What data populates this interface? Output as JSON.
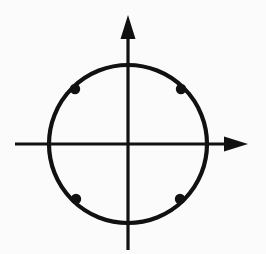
{
  "figure": {
    "background_color": "#fbfbfb",
    "stroke_color": "#111111",
    "width": 266,
    "height": 254
  },
  "chart_data": {
    "type": "scatter",
    "subtitle": "",
    "xlabel": "",
    "ylabel": "",
    "grid": false,
    "legend": null,
    "legend_position": "none",
    "axis_style": "arrowed-cartesian",
    "origin_px": {
      "x": 128,
      "y": 144
    },
    "xlim": [
      -1.43,
      1.52
    ],
    "ylim": [
      -1.34,
      1.63
    ],
    "x_ticks": [],
    "y_ticks": [],
    "x_tick_labels": [],
    "y_tick_labels": [],
    "annotations": [],
    "shapes": [
      {
        "name": "circle",
        "kind": "circle",
        "center": [
          0,
          0
        ],
        "radius": 1,
        "center_px": [
          128,
          144
        ],
        "radius_px": 79,
        "stroke": "#111111",
        "stroke_width_px": 4.2,
        "fill": "none"
      }
    ],
    "axes": [
      {
        "name": "x-axis",
        "orientation": "horizontal",
        "from_px": [
          15,
          144
        ],
        "to_px": [
          248,
          144
        ],
        "arrow": "end",
        "stroke_width_px": 3.2
      },
      {
        "name": "y-axis",
        "orientation": "vertical",
        "from_px": [
          128,
          250
        ],
        "to_px": [
          128,
          15
        ],
        "arrow": "end",
        "stroke_width_px": 3.2
      }
    ],
    "series": [
      {
        "name": "marked points",
        "marker": "filled-circle",
        "marker_radius_px": 5.2,
        "color": "#111111",
        "angles_deg": [
          45,
          135,
          225,
          315
        ],
        "x": [
          0.707,
          -0.707,
          -0.707,
          0.707
        ],
        "y": [
          0.707,
          0.707,
          -0.707,
          -0.707
        ],
        "points_px": [
          {
            "label": "upper-right",
            "angle_deg": 45,
            "x": 181,
            "y": 89
          },
          {
            "label": "upper-left",
            "angle_deg": 135,
            "x": 75,
            "y": 89
          },
          {
            "label": "lower-left",
            "angle_deg": 225,
            "x": 76,
            "y": 199
          },
          {
            "label": "lower-right",
            "angle_deg": 315,
            "x": 180,
            "y": 199
          }
        ]
      }
    ]
  }
}
